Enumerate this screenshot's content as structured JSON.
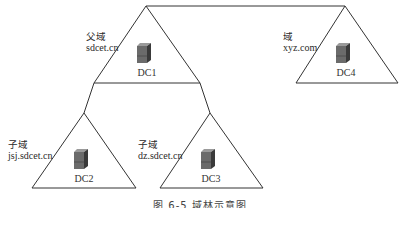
{
  "diagram": {
    "title": "域林示意图",
    "caption": "图 6-5   域林示意图",
    "domains": [
      {
        "id": "dc1",
        "type_label": "父域",
        "domain_name": "sdcet.cn",
        "controller": "DC1"
      },
      {
        "id": "dc4",
        "type_label": "域",
        "domain_name": "xyz.com",
        "controller": "DC4"
      },
      {
        "id": "dc2",
        "type_label": "子域",
        "domain_name": "jsj.sdcet.cn",
        "controller": "DC2"
      },
      {
        "id": "dc3",
        "type_label": "子域",
        "domain_name": "dz.sdcet.cn",
        "controller": "DC3"
      }
    ],
    "edges": [
      {
        "from": "DC1",
        "to": "DC4",
        "kind": "tree-root-link"
      },
      {
        "from": "DC1",
        "to": "DC2",
        "kind": "parent-child"
      },
      {
        "from": "DC1",
        "to": "DC3",
        "kind": "parent-child"
      }
    ],
    "colors": {
      "line": "#333333",
      "server_front": "#6b6b6b",
      "server_side": "#3a3a3a",
      "server_top": "#9a9a9a"
    }
  }
}
